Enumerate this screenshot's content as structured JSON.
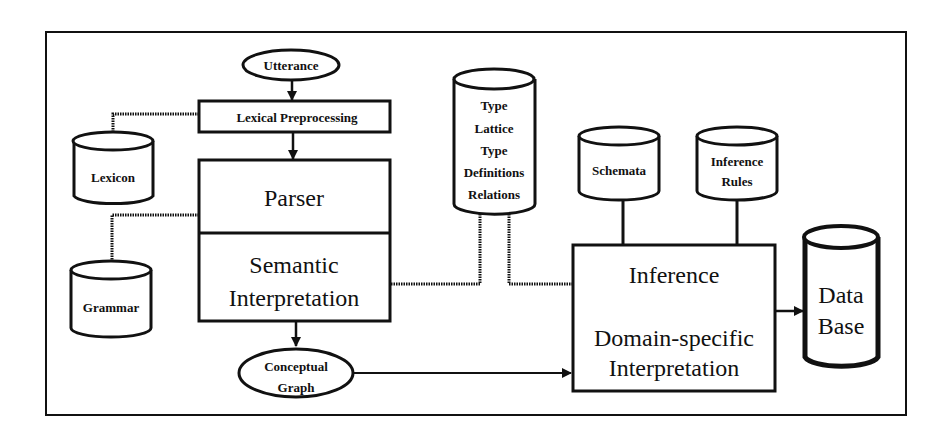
{
  "diagram": {
    "nodes": {
      "utterance": {
        "label": "Utterance",
        "shape": "ellipse"
      },
      "lexical_preprocessing": {
        "label": "Lexical Preprocessing",
        "shape": "box"
      },
      "lexicon": {
        "label": "Lexicon",
        "shape": "cylinder"
      },
      "parser": {
        "label": "Parser",
        "shape": "box"
      },
      "semantic_interpretation": {
        "line1": "Semantic",
        "line2": "Interpretation",
        "shape": "box"
      },
      "grammar": {
        "label": "Grammar",
        "shape": "cylinder"
      },
      "conceptual_graph": {
        "line1": "Conceptual",
        "line2": "Graph",
        "shape": "ellipse"
      },
      "type_store": {
        "lines": [
          "Type",
          "Lattice",
          "Type",
          "Definitions",
          "Relations"
        ],
        "shape": "cylinder"
      },
      "schemata": {
        "label": "Schemata",
        "shape": "cylinder"
      },
      "inference_rules": {
        "line1": "Inference",
        "line2": "Rules",
        "shape": "cylinder"
      },
      "inference": {
        "line1": "Inference",
        "line2": "Domain-specific",
        "line3": "Interpretation",
        "shape": "box"
      },
      "database": {
        "line1": "Data",
        "line2": "Base",
        "shape": "cylinder"
      }
    },
    "edges": [
      {
        "from": "Utterance",
        "to": "Lexical Preprocessing",
        "style": "arrow"
      },
      {
        "from": "Lexical Preprocessing",
        "to": "Parser",
        "style": "arrow"
      },
      {
        "from": "Lexicon",
        "to": "Lexical Preprocessing",
        "style": "wavy"
      },
      {
        "from": "Grammar",
        "to": "Parser",
        "style": "wavy"
      },
      {
        "from": "Semantic Interpretation",
        "to": "Type Lattice / Type Definitions / Relations",
        "style": "wavy"
      },
      {
        "from": "Type Lattice / Type Definitions / Relations",
        "to": "Inference",
        "style": "wavy"
      },
      {
        "from": "Semantic Interpretation",
        "to": "Conceptual Graph",
        "style": "arrow"
      },
      {
        "from": "Conceptual Graph",
        "to": "Inference",
        "style": "arrow"
      },
      {
        "from": "Schemata",
        "to": "Inference",
        "style": "line"
      },
      {
        "from": "Inference Rules",
        "to": "Inference",
        "style": "line"
      },
      {
        "from": "Inference",
        "to": "Data Base",
        "style": "arrow"
      }
    ],
    "colors": {
      "ink": "#111111",
      "background": "#ffffff"
    }
  }
}
